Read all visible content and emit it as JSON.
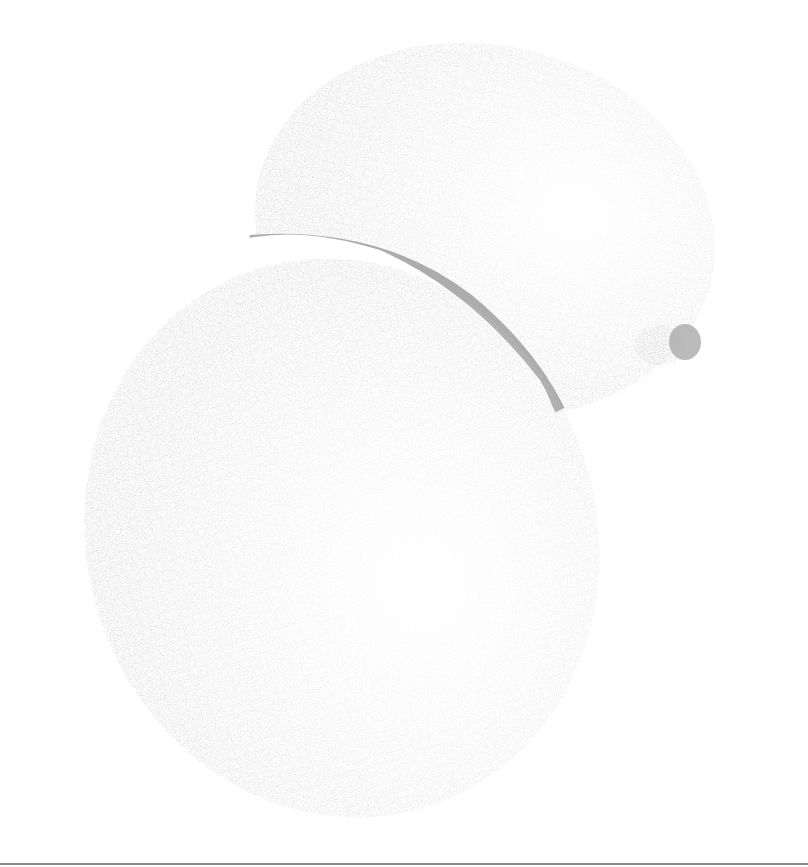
{
  "image": {
    "subject": "Stippled illustration of two mangoes",
    "style": "stipple / dot engraving, grayscale",
    "colors": {
      "ink": "#999999",
      "shadow": "#8c8c8c",
      "background": "#ffffff",
      "rule": "#8a8a8a"
    }
  },
  "objects": [
    {
      "name": "front-mango",
      "description": "large oval fruit, lower left, highlight lower-right center"
    },
    {
      "name": "back-mango",
      "description": "smaller oval fruit, upper right, with stem nub on right side"
    }
  ]
}
